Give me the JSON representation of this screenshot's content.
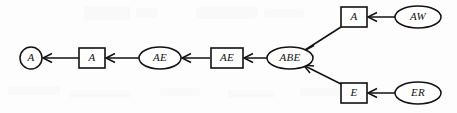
{
  "diagram": {
    "type": "directed-graph",
    "background_color": "#fdfdfd",
    "stroke_color": "#111111",
    "fill_color": "#ffffff",
    "nodes": [
      {
        "id": "a-circle",
        "label": "A",
        "shape": "circle",
        "cx": 31,
        "cy": 58,
        "rx": 11,
        "ry": 11
      },
      {
        "id": "a-square",
        "label": "A",
        "shape": "square",
        "cx": 92,
        "cy": 58,
        "w": 26,
        "h": 20
      },
      {
        "id": "ae-ellipse",
        "label": "AE",
        "shape": "ellipse",
        "cx": 160,
        "cy": 58,
        "rx": 21,
        "ry": 11
      },
      {
        "id": "ae-square",
        "label": "AE",
        "shape": "square",
        "cx": 227,
        "cy": 58,
        "w": 32,
        "h": 20
      },
      {
        "id": "abe-ellipse",
        "label": "ABE",
        "shape": "ellipse",
        "cx": 290,
        "cy": 58,
        "rx": 23,
        "ry": 11
      },
      {
        "id": "a-square-top",
        "label": "A",
        "shape": "square",
        "cx": 354,
        "cy": 17,
        "w": 26,
        "h": 20
      },
      {
        "id": "aw-ellipse",
        "label": "AW",
        "shape": "ellipse",
        "cx": 418,
        "cy": 17,
        "rx": 23,
        "ry": 11
      },
      {
        "id": "e-square",
        "label": "E",
        "shape": "square",
        "cx": 354,
        "cy": 93,
        "w": 26,
        "h": 20
      },
      {
        "id": "er-ellipse",
        "label": "ER",
        "shape": "ellipse",
        "cx": 418,
        "cy": 93,
        "rx": 23,
        "ry": 11
      }
    ],
    "edges": [
      {
        "id": "edge-a-square-to-a-circle",
        "from": "a-square",
        "to": "a-circle",
        "direction": "left"
      },
      {
        "id": "edge-ae-ellipse-to-a-square",
        "from": "ae-ellipse",
        "to": "a-square",
        "direction": "left"
      },
      {
        "id": "edge-ae-square-to-ae-ellipse",
        "from": "ae-square",
        "to": "ae-ellipse",
        "direction": "left"
      },
      {
        "id": "edge-abe-to-ae-square",
        "from": "abe-ellipse",
        "to": "ae-square",
        "direction": "left"
      },
      {
        "id": "edge-a-square-top-to-abe",
        "from": "a-square-top",
        "to": "abe-ellipse",
        "direction": "down-left"
      },
      {
        "id": "edge-aw-to-a-square-top",
        "from": "aw-ellipse",
        "to": "a-square-top",
        "direction": "left"
      },
      {
        "id": "edge-e-square-to-abe",
        "from": "e-square",
        "to": "abe-ellipse",
        "direction": "up-left"
      },
      {
        "id": "edge-er-to-e-square",
        "from": "er-ellipse",
        "to": "e-square",
        "direction": "left"
      }
    ]
  }
}
